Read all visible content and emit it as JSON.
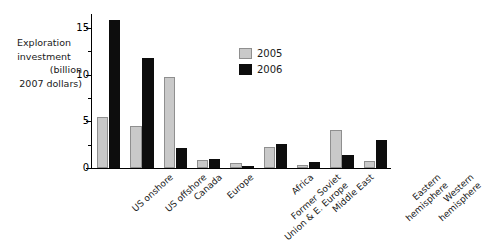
{
  "chart_data": {
    "type": "bar",
    "title": "",
    "xlabel": "",
    "ylabel": "Exploration investment (billion 2007 dollars)",
    "ylabel_lines": [
      "Exploration",
      "investment",
      "(billion",
      "2007 dollars)"
    ],
    "ylim": [
      0,
      16.5
    ],
    "yticks": [
      0,
      5,
      10,
      15
    ],
    "ytick_labels": [
      "0",
      "5",
      "10",
      "15"
    ],
    "yticks_minor": [
      2.5,
      7.5,
      12.5
    ],
    "grid": false,
    "legend_position": "upper-right",
    "categories": [
      "US onshore",
      "US offshore",
      "Canada",
      "Europe",
      "Former Soviet Union & E. Europe",
      "Africa",
      "Middle East",
      "Eastern hemisphere",
      "Western hemisphere"
    ],
    "series": [
      {
        "name": "2005",
        "color": "#c9c9c9",
        "values": [
          5.5,
          4.5,
          9.8,
          0.9,
          0.55,
          2.2,
          0.35,
          4.1,
          0.7
        ]
      },
      {
        "name": "2006",
        "color": "#0d0d0d",
        "values": [
          15.9,
          11.8,
          2.1,
          1.0,
          0.15,
          2.6,
          0.65,
          1.4,
          3.0
        ]
      }
    ]
  },
  "legend": {
    "items": [
      {
        "label": "2005",
        "swatch": "gray-swatch"
      },
      {
        "label": "2006",
        "swatch": "black-swatch"
      }
    ]
  }
}
